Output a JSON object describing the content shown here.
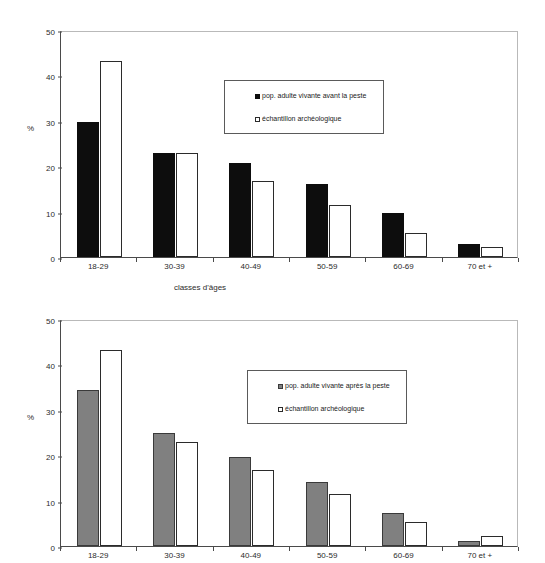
{
  "figure": {
    "background": "#ffffff",
    "charts": [
      {
        "id": "top",
        "series_color": "#0d0d0d",
        "comparison_color": "#ffffff"
      },
      {
        "id": "bottom",
        "series_color": "#808080",
        "comparison_color": "#ffffff"
      }
    ]
  },
  "chart_data": [
    {
      "type": "bar",
      "title": "",
      "xlabel": "classes d'âges",
      "ylabel": "%",
      "ylim": [
        0,
        50
      ],
      "yticks": [
        0,
        10,
        20,
        30,
        40,
        50
      ],
      "ytick_labels": [
        "0",
        "10",
        "20",
        "30",
        "40",
        "50"
      ],
      "grid": false,
      "legend_position": "upper center",
      "categories": [
        "18-29",
        "30-39",
        "40-49",
        "50-59",
        "60-69",
        "70 et +"
      ],
      "series": [
        {
          "name": "pop. adulte vivante avant la peste",
          "color": "#0d0d0d",
          "marker": "filled-square",
          "values": [
            29.7,
            23.0,
            20.8,
            16.0,
            9.7,
            2.8
          ]
        },
        {
          "name": "échantillon archéologique",
          "color": "#ffffff",
          "marker": "open-square",
          "values": [
            43.1,
            23.0,
            16.8,
            11.4,
            5.2,
            2.3
          ]
        }
      ]
    },
    {
      "type": "bar",
      "title": "",
      "xlabel": "",
      "ylabel": "%",
      "ylim": [
        0,
        50
      ],
      "yticks": [
        0,
        10,
        20,
        30,
        40,
        50
      ],
      "ytick_labels": [
        "0",
        "10",
        "20",
        "30",
        "40",
        "50"
      ],
      "grid": false,
      "legend_position": "upper center",
      "categories": [
        "18-29",
        "30-39",
        "40-49",
        "50-59",
        "60-69",
        "70 et +"
      ],
      "series": [
        {
          "name": "pop. adulte vivante après la peste",
          "color": "#808080",
          "marker": "filled-square",
          "values": [
            34.3,
            25.0,
            19.7,
            14.1,
            7.3,
            1.1
          ]
        },
        {
          "name": "échantillon archéologique",
          "color": "#ffffff",
          "marker": "open-square",
          "values": [
            43.1,
            23.0,
            16.8,
            11.4,
            5.2,
            2.3
          ]
        }
      ]
    }
  ]
}
